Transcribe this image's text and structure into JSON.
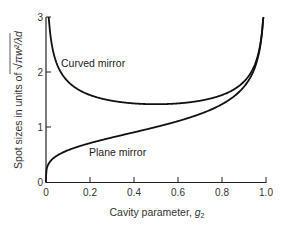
{
  "chart_data": {
    "type": "line",
    "title": "",
    "xlabel": "Cavity parameter, g2",
    "xlabel_main": "Cavity parameter, ",
    "xlabel_sub": "g",
    "xlabel_subscript": "2",
    "ylabel": "Spot sizes in units of √(πw²/λd)",
    "ylabel_main": "Spot sizes in units of ",
    "ylabel_sqrt": "√",
    "ylabel_radicand": "πw²/λd",
    "xlim": [
      0,
      1.0
    ],
    "ylim": [
      0,
      3
    ],
    "x_ticks": [
      "0",
      "0.2",
      "0.4",
      "0.6",
      "0.8",
      "1.0"
    ],
    "y_ticks": [
      "0",
      "1",
      "2",
      "3"
    ],
    "grid": false,
    "series": [
      {
        "name": "Curved mirror",
        "x": [
          0.012,
          0.02,
          0.04,
          0.06,
          0.1,
          0.15,
          0.2,
          0.3,
          0.4,
          0.5,
          0.6,
          0.7,
          0.8,
          0.85,
          0.9,
          0.94,
          0.97,
          0.99
        ],
        "values": [
          3.0,
          2.67,
          2.25,
          2.04,
          1.8,
          1.65,
          1.58,
          1.48,
          1.43,
          1.41,
          1.43,
          1.48,
          1.58,
          1.65,
          1.8,
          2.02,
          2.4,
          3.0
        ]
      },
      {
        "name": "Plane mirror",
        "x": [
          0,
          0.005,
          0.02,
          0.05,
          0.1,
          0.2,
          0.3,
          0.4,
          0.5,
          0.6,
          0.7,
          0.8,
          0.85,
          0.9,
          0.94,
          0.97,
          0.99
        ],
        "values": [
          0,
          0.27,
          0.38,
          0.48,
          0.58,
          0.71,
          0.81,
          0.9,
          1.0,
          1.11,
          1.24,
          1.41,
          1.51,
          1.73,
          1.99,
          2.37,
          3.0
        ]
      }
    ],
    "annotations": [
      {
        "text": "Curved mirror",
        "x": 0.06,
        "y": 2.2
      },
      {
        "text": "Plane mirror",
        "x": 0.2,
        "y": 0.5
      }
    ]
  }
}
